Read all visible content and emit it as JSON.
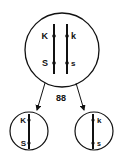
{
  "diagram": {
    "label": "88",
    "parent_cell": {
      "chromosomes": [
        {
          "top_label": "K",
          "bottom_label": "S"
        },
        {
          "top_label": "k",
          "bottom_label": "s"
        }
      ]
    },
    "daughter_cells": [
      {
        "top_label": "K",
        "bottom_label": "S"
      },
      {
        "top_label": "k",
        "bottom_label": "s"
      }
    ],
    "colors": {
      "stroke": "#111111",
      "background": "#ffffff"
    }
  }
}
